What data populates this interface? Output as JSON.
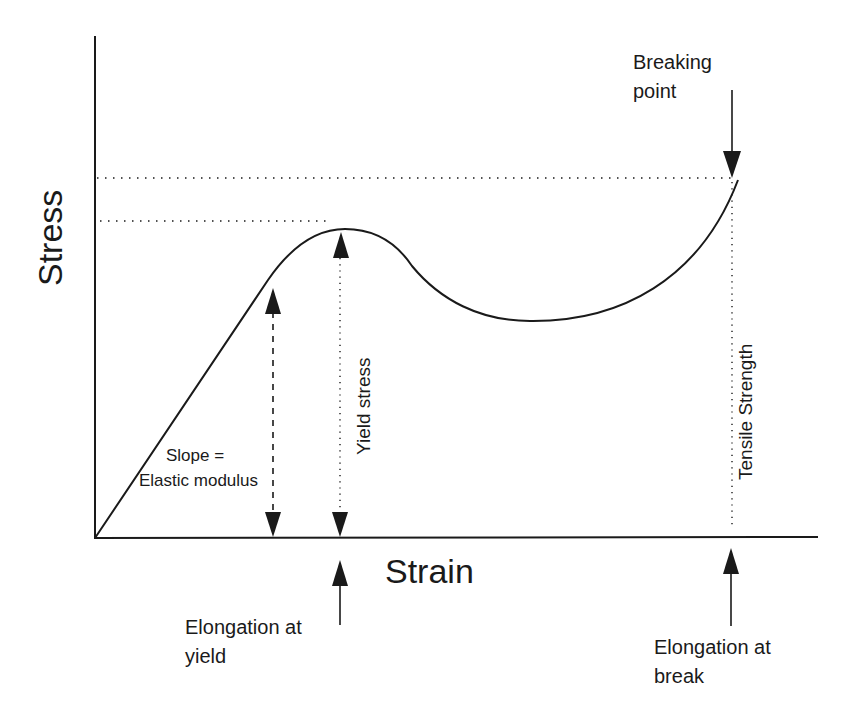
{
  "diagram": {
    "axes": {
      "y_label": "Stress",
      "x_label": "Strain"
    },
    "annotations": {
      "breaking_point": [
        "Breaking",
        "point"
      ],
      "slope": [
        "Slope =",
        "Elastic modulus"
      ],
      "yield_stress": "Yield stress",
      "tensile_strength": "Tensile Strength",
      "elongation_yield": [
        "Elongation at",
        "yield"
      ],
      "elongation_break": [
        "Elongation at",
        "break"
      ]
    },
    "colors": {
      "ink": "#1a1a1a",
      "background": "#ffffff"
    }
  }
}
